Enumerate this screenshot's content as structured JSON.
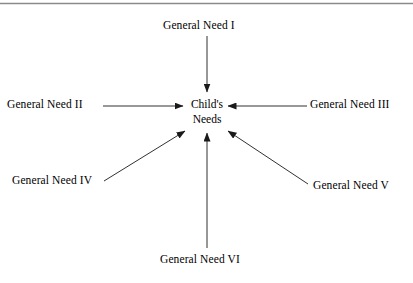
{
  "figure": {
    "top_rule_color": "#8a8a8a",
    "line_color": "#1a1a1a",
    "text_color": "#000000",
    "background_color": "#ffffff"
  },
  "center": {
    "line1": "Child's",
    "line2": "Needs"
  },
  "nodes": [
    {
      "id": "need-1",
      "label": "General Need I",
      "position": "top"
    },
    {
      "id": "need-2",
      "label": "General Need II",
      "position": "left"
    },
    {
      "id": "need-3",
      "label": "General Need III",
      "position": "right"
    },
    {
      "id": "need-4",
      "label": "General Need IV",
      "position": "bottom-left"
    },
    {
      "id": "need-5",
      "label": "General Need V",
      "position": "bottom-right"
    },
    {
      "id": "need-6",
      "label": "General Need VI",
      "position": "bottom"
    }
  ],
  "arrows": [
    {
      "from": "need-1",
      "to": "center",
      "direction": "down"
    },
    {
      "from": "need-2",
      "to": "center",
      "direction": "right"
    },
    {
      "from": "need-3",
      "to": "center",
      "direction": "left"
    },
    {
      "from": "need-4",
      "to": "center",
      "direction": "up-right"
    },
    {
      "from": "need-5",
      "to": "center",
      "direction": "up-left"
    },
    {
      "from": "need-6",
      "to": "center",
      "direction": "up"
    }
  ]
}
